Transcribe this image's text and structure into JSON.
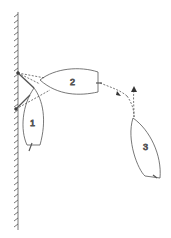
{
  "diagram": {
    "type": "sailing-maneuver",
    "colors": {
      "line": "#444444",
      "background": "#ffffff"
    },
    "boats": [
      {
        "id": "boat-1",
        "label": "1"
      },
      {
        "id": "boat-2",
        "label": "2"
      },
      {
        "id": "boat-3",
        "label": "3"
      }
    ],
    "elements": [
      "wall-with-hatching",
      "dashed-paths",
      "arrows"
    ]
  }
}
